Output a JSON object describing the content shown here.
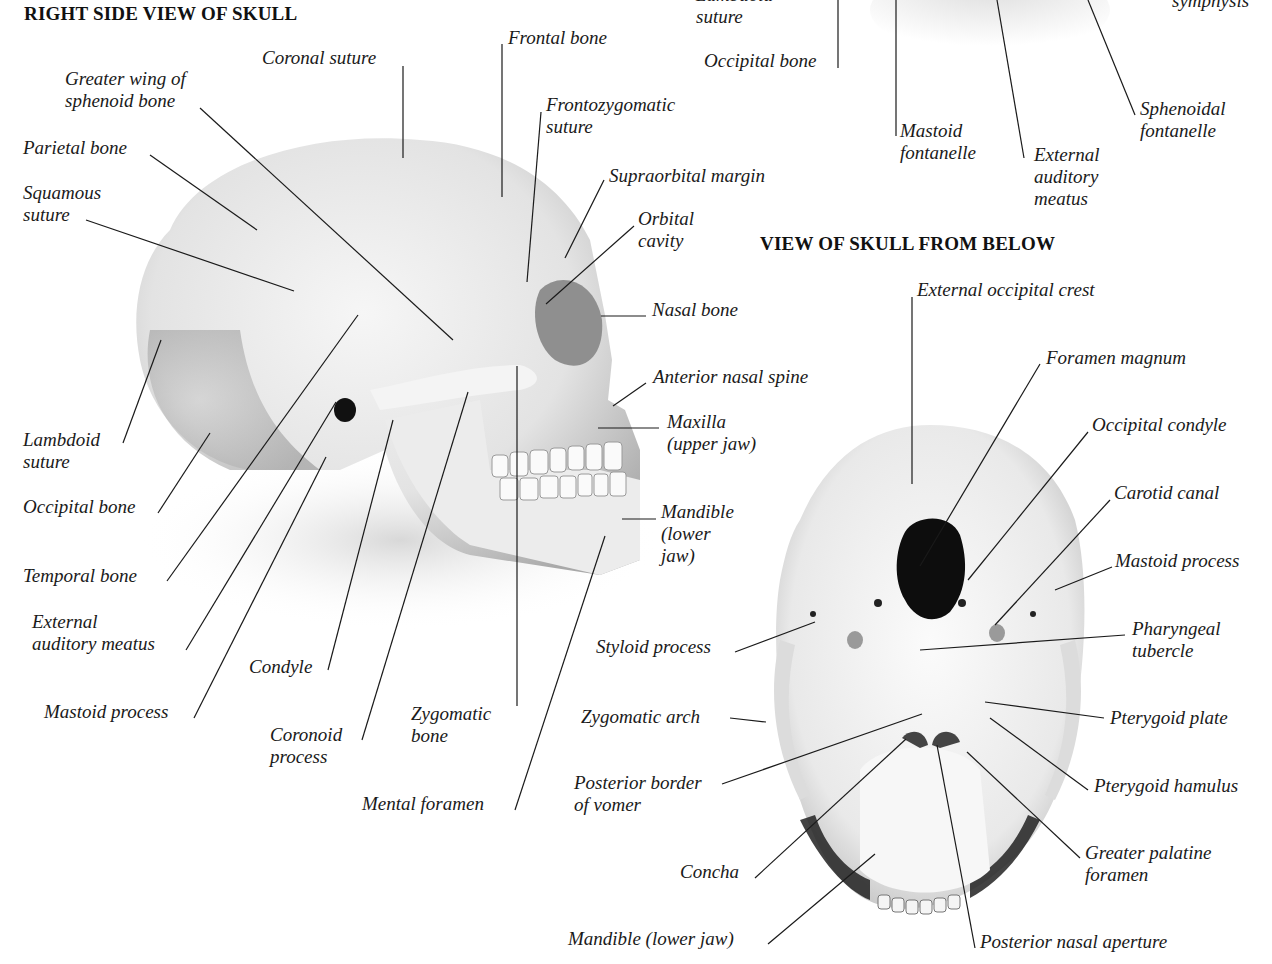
{
  "figure": {
    "left_view": {
      "title": "RIGHT SIDE VIEW OF SKULL",
      "labels": {
        "coronal_suture": [
          "Coronal suture"
        ],
        "frontal_bone": [
          "Frontal bone"
        ],
        "greater_wing": [
          "Greater wing of",
          "sphenoid bone"
        ],
        "frontozygomatic": [
          "Frontozygomatic",
          "suture"
        ],
        "parietal_bone": [
          "Parietal bone"
        ],
        "supraorbital": [
          "Supraorbital margin"
        ],
        "squamous_suture": [
          "Squamous",
          "suture"
        ],
        "orbital_cavity": [
          "Orbital",
          "cavity"
        ],
        "nasal_bone": [
          "Nasal bone"
        ],
        "anterior_nasal_spine": [
          "Anterior nasal spine"
        ],
        "lambdoid_suture": [
          "Lambdoid",
          "suture"
        ],
        "maxilla": [
          "Maxilla",
          "(upper jaw)"
        ],
        "occipital_bone": [
          "Occipital bone"
        ],
        "mandible": [
          "Mandible",
          "(lower",
          "jaw)"
        ],
        "temporal_bone": [
          "Temporal bone"
        ],
        "external_auditory_meatus": [
          "External",
          "auditory meatus"
        ],
        "condyle": [
          "Condyle"
        ],
        "mastoid_process": [
          "Mastoid process"
        ],
        "zygomatic_bone": [
          "Zygomatic",
          "bone"
        ],
        "coronoid_process": [
          "Coronoid",
          "process"
        ],
        "mental_foramen": [
          "Mental foramen"
        ]
      }
    },
    "top_right_partial": {
      "labels": {
        "lambdoid_suture_partial": [
          "Lambdoid",
          "suture"
        ],
        "occipital_bone": [
          "Occipital bone"
        ],
        "symphysis_partial": [
          "symphysis"
        ],
        "mastoid_fontanelle": [
          "Mastoid",
          "fontanelle"
        ],
        "external_auditory_meatus": [
          "External",
          "auditory",
          "meatus"
        ],
        "sphenoidal_fontanelle": [
          "Sphenoidal",
          "fontanelle"
        ]
      }
    },
    "bottom_view": {
      "title": "VIEW OF SKULL FROM BELOW",
      "labels": {
        "external_occipital_crest": [
          "External occipital crest"
        ],
        "foramen_magnum": [
          "Foramen magnum"
        ],
        "occipital_condyle": [
          "Occipital condyle"
        ],
        "carotid_canal": [
          "Carotid canal"
        ],
        "mastoid_process": [
          "Mastoid process"
        ],
        "styloid_process": [
          "Styloid process"
        ],
        "pharyngeal_tubercle": [
          "Pharyngeal",
          "tubercle"
        ],
        "zygomatic_arch": [
          "Zygomatic arch"
        ],
        "pterygoid_plate": [
          "Pterygoid plate"
        ],
        "posterior_border_vomer": [
          "Posterior border",
          "of vomer"
        ],
        "pterygoid_hamulus": [
          "Pterygoid hamulus"
        ],
        "greater_palatine_foramen": [
          "Greater palatine",
          "foramen"
        ],
        "concha": [
          "Concha"
        ],
        "mandible": [
          "Mandible (lower jaw)"
        ],
        "posterior_nasal_aperture": [
          "Posterior nasal aperture"
        ]
      }
    },
    "colors": {
      "ink": "#1a1a1a",
      "bone_light": "#f2f2f2",
      "bone_mid": "#cfcfcf",
      "bone_shadow": "#8a8a8a",
      "hole": "#0d0d0d"
    }
  }
}
